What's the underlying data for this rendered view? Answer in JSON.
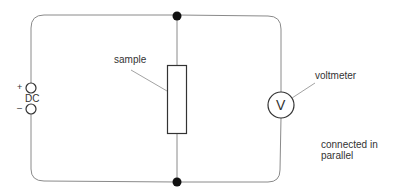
{
  "diagram": {
    "type": "circuit",
    "labels": {
      "sample": "sample",
      "voltmeter": "voltmeter",
      "voltmeter_symbol": "V",
      "dc": "DC",
      "plus": "+",
      "minus": "–",
      "note_line1": "connected in",
      "note_line2": "parallel"
    },
    "colors": {
      "wire": "#8a8a8a",
      "component": "#333333",
      "junction": "#111111",
      "text": "#333333"
    }
  }
}
